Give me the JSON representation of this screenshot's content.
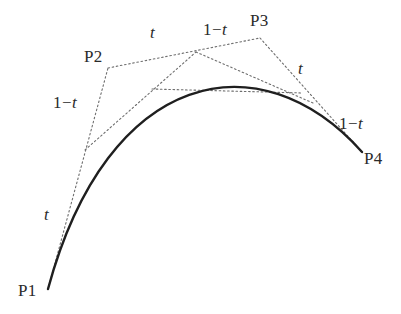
{
  "figure": {
    "background_color": "#ffffff",
    "curve_color": "#1f1f1f",
    "construction_color": "#6e6e6e",
    "label_color": "#2a2a2a",
    "curve": {
      "type": "cubic-bezier",
      "start": [
        48,
        289
      ],
      "control1": [
        108,
        68
      ],
      "control2": [
        260,
        38
      ],
      "end": [
        362,
        152
      ],
      "stroke_width": 2.4
    },
    "control_points": [
      {
        "id": "P1",
        "label": "P1",
        "x": 48,
        "y": 289,
        "label_x": 18,
        "label_y": 282
      },
      {
        "id": "P2",
        "label": "P2",
        "x": 108,
        "y": 68,
        "label_x": 84,
        "label_y": 48
      },
      {
        "id": "P3",
        "label": "P3",
        "x": 260,
        "y": 38,
        "label_x": 250,
        "label_y": 12
      },
      {
        "id": "P4",
        "label": "P4",
        "x": 362,
        "y": 152,
        "label_x": 364,
        "label_y": 150
      }
    ],
    "construction_lines": [
      {
        "name": "hull-p1-p2",
        "from": [
          48,
          289
        ],
        "to": [
          108,
          68
        ]
      },
      {
        "name": "hull-p2-p3",
        "from": [
          108,
          68
        ],
        "to": [
          260,
          38
        ]
      },
      {
        "name": "hull-p3-p4",
        "from": [
          260,
          38
        ],
        "to": [
          362,
          152
        ]
      },
      {
        "name": "level1-a-b",
        "from": [
          85,
          150
        ],
        "to": [
          196,
          52
        ]
      },
      {
        "name": "level1-b-c",
        "from": [
          196,
          52
        ],
        "to": [
          313,
          103
        ]
      },
      {
        "name": "level2-d-e",
        "from": [
          152,
          89
        ],
        "to": [
          303,
          93
        ]
      }
    ],
    "ratio_labels": [
      {
        "name": "t-lower-left",
        "numerator": "t",
        "has_one_minus": false,
        "x": 44,
        "y": 206
      },
      {
        "name": "one-minus-t-left",
        "numerator": "t",
        "has_one_minus": true,
        "x": 53,
        "y": 94
      },
      {
        "name": "t-upper-left",
        "numerator": "t",
        "has_one_minus": false,
        "x": 150,
        "y": 24
      },
      {
        "name": "one-minus-t-top",
        "numerator": "t",
        "has_one_minus": true,
        "x": 203,
        "y": 21
      },
      {
        "name": "t-right",
        "numerator": "t",
        "has_one_minus": false,
        "x": 298,
        "y": 60
      },
      {
        "name": "one-minus-t-right",
        "numerator": "t",
        "has_one_minus": true,
        "x": 339,
        "y": 115
      }
    ],
    "text": {
      "one": "1",
      "minus": "−",
      "t": "t"
    }
  }
}
